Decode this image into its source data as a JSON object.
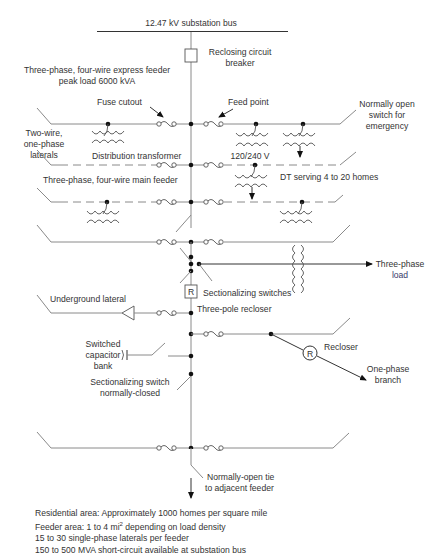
{
  "diagram": {
    "title": "12.47 kV substation bus",
    "labels": {
      "breaker": [
        "Reclosing circuit",
        "breaker"
      ],
      "express_feeder": [
        "Three-phase, four-wire express feeder",
        "peak load 6000 kVA"
      ],
      "fuse_cutout": "Fuse cutout",
      "feed_point": "Feed point",
      "normally_open_switch": [
        "Normally open",
        "switch for",
        "emergency"
      ],
      "two_wire_laterals": [
        "Two-wire,",
        "one-phase",
        "laterals"
      ],
      "distribution_transformer": "Distribution transformer",
      "voltage": "120/240 V",
      "main_feeder": "Three-phase, four-wire main feeder",
      "dt_serving": "DT serving 4 to 20 homes",
      "three_phase_load": [
        "Three-phase",
        "load"
      ],
      "sectionalizing_switches": "Sectionalizing switches",
      "recloser_box_letter": "R",
      "underground_lateral": "Underground lateral",
      "three_pole_recloser": "Three-pole recloser",
      "switched_capacitor": [
        "Switched",
        "capacitor",
        "bank"
      ],
      "recloser": "Recloser",
      "recloser_circle_letter": "R",
      "one_phase_branch": [
        "One-phase",
        "branch"
      ],
      "sectionalizing_switch_nc": [
        "Sectionalizing switch",
        "normally-closed"
      ],
      "normally_open_tie": [
        "Normally-open tie",
        "to adjacent feeder"
      ]
    },
    "notes": [
      "Residential area: Approximately 1000 homes per square mile",
      "Feeder area: 1 to 4 mi",
      "2",
      " depending on load density",
      "15 to 30 single-phase laterals per feeder",
      "150 to 500 MVA short-circuit available at substation bus"
    ],
    "colors": {
      "line": "#8a8a8a",
      "text": "#333333",
      "load_text": "#3a3a6a"
    }
  }
}
